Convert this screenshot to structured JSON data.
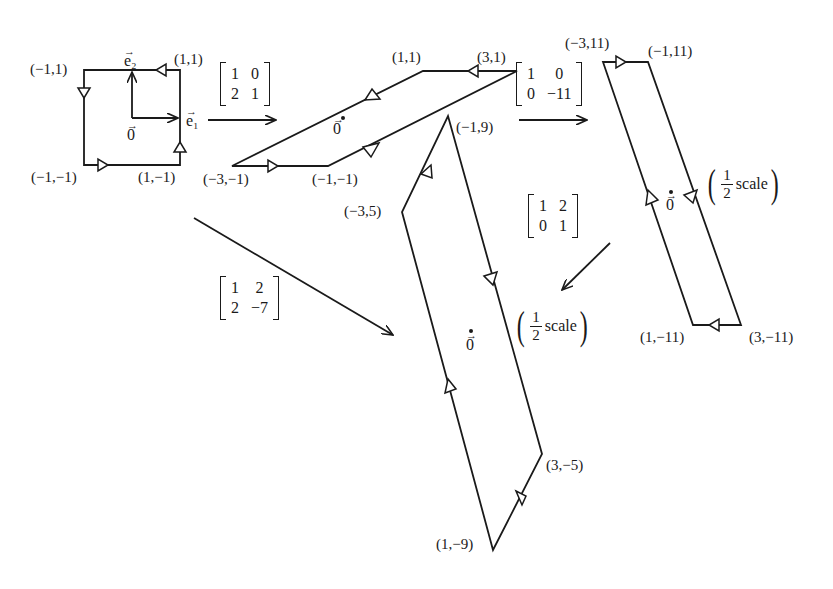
{
  "square": {
    "vertices": [
      {
        "label": "(−1,1)"
      },
      {
        "label": "(1,1)"
      },
      {
        "label": "(−1,−1)"
      },
      {
        "label": "(1,−1)"
      }
    ],
    "e1": "e₁",
    "e2": "e₂",
    "origin": "0"
  },
  "matrix_A": {
    "rows": [
      [
        "1",
        "0"
      ],
      [
        "2",
        "1"
      ]
    ]
  },
  "parallelogram_1": {
    "vertices": [
      {
        "label": "(1,1)"
      },
      {
        "label": "(3,1)"
      },
      {
        "label": "(−3,−1)"
      },
      {
        "label": "(−1,−1)"
      }
    ],
    "origin": "0"
  },
  "matrix_B": {
    "rows": [
      [
        "1",
        "0"
      ],
      [
        "0",
        "−11"
      ]
    ]
  },
  "parallelogram_2": {
    "vertices": [
      {
        "label": "(−3,11)"
      },
      {
        "label": "(−1,11)"
      },
      {
        "label": "(1,−11)"
      },
      {
        "label": "(3,−11)"
      }
    ],
    "origin": "0",
    "scale": {
      "num": "1",
      "den": "2",
      "word": "scale"
    }
  },
  "matrix_C": {
    "rows": [
      [
        "1",
        "2"
      ],
      [
        "0",
        "1"
      ]
    ]
  },
  "matrix_D": {
    "rows": [
      [
        "1",
        "2"
      ],
      [
        "2",
        "−7"
      ]
    ]
  },
  "parallelogram_3": {
    "vertices": [
      {
        "label": "(−1,9)"
      },
      {
        "label": "(−3,5)"
      },
      {
        "label": "(3,−5)"
      },
      {
        "label": "(1,−9)"
      }
    ],
    "origin": "0",
    "scale": {
      "num": "1",
      "den": "2",
      "word": "scale"
    }
  }
}
